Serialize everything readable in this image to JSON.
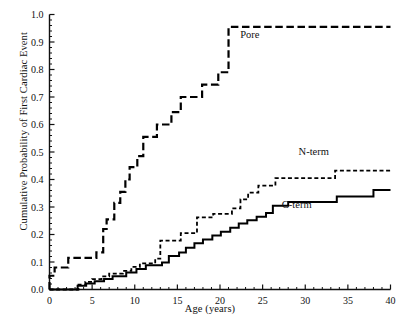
{
  "chart_data": {
    "type": "line",
    "subtype": "kaplan-meier-step",
    "title": "",
    "xlabel": "Age (years)",
    "ylabel": "Cumulative Probability of First Cardiac Event",
    "xlim": [
      0,
      40
    ],
    "ylim": [
      0,
      1.0
    ],
    "xticks": [
      0,
      5,
      10,
      15,
      20,
      25,
      30,
      35,
      40
    ],
    "xtick_labels": [
      "0",
      "5",
      "10",
      "15",
      "20",
      "25",
      "30",
      "35",
      "40"
    ],
    "yticks": [
      0.0,
      0.1,
      0.2,
      0.3,
      0.4,
      0.5,
      0.6,
      0.7,
      0.8,
      0.9,
      1.0
    ],
    "ytick_labels": [
      "0.0",
      "0.1",
      "0.2",
      "0.3",
      "0.4",
      "0.5",
      "0.6",
      "0.7",
      "0.8",
      "0.9",
      "1.0"
    ],
    "minor_ticks": true,
    "grid": false,
    "legend_position": "inline-annotations",
    "series": [
      {
        "name": "Pore",
        "label": "Pore",
        "style": "long-dashed",
        "color": "#000000",
        "linewidth": 2.2,
        "label_xy": [
          23.5,
          0.915
        ],
        "points": [
          [
            0,
            0.0
          ],
          [
            0,
            0.05
          ],
          [
            0.6,
            0.05
          ],
          [
            0.6,
            0.08
          ],
          [
            2.2,
            0.08
          ],
          [
            2.2,
            0.115
          ],
          [
            5.5,
            0.115
          ],
          [
            5.5,
            0.135
          ],
          [
            6.3,
            0.135
          ],
          [
            6.3,
            0.22
          ],
          [
            6.7,
            0.22
          ],
          [
            6.7,
            0.255
          ],
          [
            7.6,
            0.255
          ],
          [
            7.6,
            0.315
          ],
          [
            8.3,
            0.315
          ],
          [
            8.3,
            0.355
          ],
          [
            8.9,
            0.355
          ],
          [
            8.9,
            0.4
          ],
          [
            9.4,
            0.4
          ],
          [
            9.4,
            0.445
          ],
          [
            10.3,
            0.445
          ],
          [
            10.3,
            0.485
          ],
          [
            11.0,
            0.485
          ],
          [
            11.0,
            0.555
          ],
          [
            12.6,
            0.555
          ],
          [
            12.6,
            0.6
          ],
          [
            14.3,
            0.6
          ],
          [
            14.3,
            0.645
          ],
          [
            15.4,
            0.645
          ],
          [
            15.4,
            0.7
          ],
          [
            17.9,
            0.7
          ],
          [
            17.9,
            0.745
          ],
          [
            19.8,
            0.745
          ],
          [
            19.8,
            0.79
          ],
          [
            21.0,
            0.79
          ],
          [
            21.0,
            0.955
          ],
          [
            40,
            0.955
          ]
        ]
      },
      {
        "name": "N-term",
        "label": "N-term",
        "style": "short-dashed",
        "color": "#000000",
        "linewidth": 1.8,
        "label_xy": [
          31.0,
          0.49
        ],
        "points": [
          [
            0,
            0.0
          ],
          [
            3.4,
            0.0
          ],
          [
            3.4,
            0.018
          ],
          [
            4.2,
            0.018
          ],
          [
            4.2,
            0.028
          ],
          [
            5.0,
            0.028
          ],
          [
            5.0,
            0.038
          ],
          [
            6.1,
            0.038
          ],
          [
            6.1,
            0.048
          ],
          [
            7.0,
            0.048
          ],
          [
            7.0,
            0.058
          ],
          [
            8.6,
            0.058
          ],
          [
            8.6,
            0.068
          ],
          [
            9.6,
            0.068
          ],
          [
            9.6,
            0.082
          ],
          [
            10.6,
            0.082
          ],
          [
            10.6,
            0.095
          ],
          [
            12.4,
            0.095
          ],
          [
            12.4,
            0.112
          ],
          [
            13.0,
            0.112
          ],
          [
            13.0,
            0.178
          ],
          [
            15.4,
            0.178
          ],
          [
            15.4,
            0.205
          ],
          [
            17.3,
            0.205
          ],
          [
            17.3,
            0.262
          ],
          [
            19.2,
            0.262
          ],
          [
            19.2,
            0.275
          ],
          [
            21.4,
            0.275
          ],
          [
            21.4,
            0.295
          ],
          [
            22.4,
            0.295
          ],
          [
            22.4,
            0.328
          ],
          [
            23.3,
            0.328
          ],
          [
            23.3,
            0.352
          ],
          [
            24.5,
            0.352
          ],
          [
            24.5,
            0.378
          ],
          [
            26.5,
            0.378
          ],
          [
            26.5,
            0.405
          ],
          [
            33.5,
            0.405
          ],
          [
            33.5,
            0.432
          ],
          [
            40,
            0.432
          ]
        ]
      },
      {
        "name": "C-term",
        "label": "C-term",
        "style": "solid",
        "color": "#000000",
        "linewidth": 2.0,
        "label_xy": [
          29.0,
          0.295
        ],
        "points": [
          [
            0,
            0.0
          ],
          [
            3.3,
            0.0
          ],
          [
            3.3,
            0.014
          ],
          [
            4.3,
            0.014
          ],
          [
            4.3,
            0.022
          ],
          [
            5.3,
            0.022
          ],
          [
            5.3,
            0.03
          ],
          [
            6.4,
            0.03
          ],
          [
            6.4,
            0.038
          ],
          [
            7.4,
            0.038
          ],
          [
            7.4,
            0.048
          ],
          [
            9.0,
            0.048
          ],
          [
            9.0,
            0.062
          ],
          [
            10.2,
            0.062
          ],
          [
            10.2,
            0.075
          ],
          [
            11.3,
            0.075
          ],
          [
            11.3,
            0.088
          ],
          [
            13.2,
            0.088
          ],
          [
            13.2,
            0.098
          ],
          [
            14.0,
            0.098
          ],
          [
            14.0,
            0.122
          ],
          [
            15.2,
            0.122
          ],
          [
            15.2,
            0.135
          ],
          [
            16.0,
            0.135
          ],
          [
            16.0,
            0.152
          ],
          [
            17.0,
            0.152
          ],
          [
            17.0,
            0.168
          ],
          [
            18.0,
            0.168
          ],
          [
            18.0,
            0.182
          ],
          [
            19.1,
            0.182
          ],
          [
            19.1,
            0.196
          ],
          [
            20.1,
            0.196
          ],
          [
            20.1,
            0.21
          ],
          [
            21.2,
            0.21
          ],
          [
            21.2,
            0.225
          ],
          [
            22.2,
            0.225
          ],
          [
            22.2,
            0.24
          ],
          [
            23.2,
            0.24
          ],
          [
            23.2,
            0.252
          ],
          [
            24.3,
            0.252
          ],
          [
            24.3,
            0.265
          ],
          [
            25.4,
            0.265
          ],
          [
            25.4,
            0.278
          ],
          [
            26.2,
            0.278
          ],
          [
            26.2,
            0.305
          ],
          [
            28.0,
            0.305
          ],
          [
            28.0,
            0.318
          ],
          [
            33.7,
            0.318
          ],
          [
            33.7,
            0.338
          ],
          [
            38.0,
            0.338
          ],
          [
            38.0,
            0.362
          ],
          [
            40,
            0.362
          ]
        ]
      }
    ]
  },
  "axes": {
    "x_title": "Age (years)",
    "y_title": "Cumulative Probability of First Cardiac Event"
  }
}
